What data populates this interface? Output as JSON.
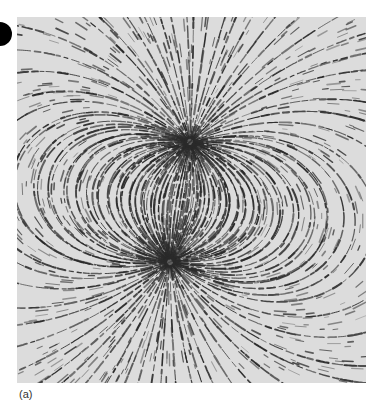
{
  "figure": {
    "caption": "(a)",
    "background_color": "#dcdcdc",
    "line_color": "#2a2a2a",
    "poles": [
      {
        "name": "upper-pole",
        "x": 173,
        "y": 125
      },
      {
        "name": "lower-pole",
        "x": 153,
        "y": 245
      }
    ]
  },
  "page_marker": {
    "color": "#000000"
  }
}
